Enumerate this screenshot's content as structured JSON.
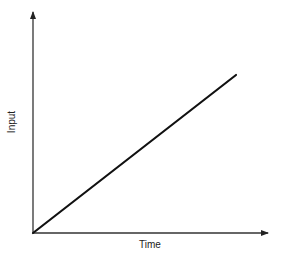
{
  "chart_data": {
    "type": "line",
    "title": "",
    "xlabel": "Time",
    "ylabel": "Input",
    "x": [
      0,
      1
    ],
    "series": [
      {
        "name": "Input",
        "values": [
          0,
          0.72
        ]
      }
    ],
    "xlim": [
      0,
      1.0
    ],
    "ylim": [
      0,
      1.0
    ],
    "grid": false,
    "legend": null,
    "ticks": "none",
    "annotations": [],
    "colors": {
      "line": "#111111",
      "axis": "#333333"
    }
  }
}
